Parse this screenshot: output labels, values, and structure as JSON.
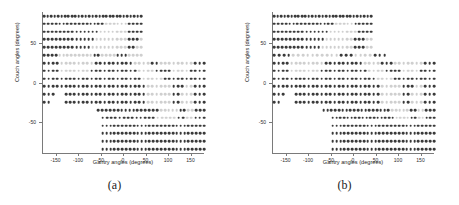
{
  "figure": {
    "panels": [
      {
        "id": "panel-a",
        "label": "(a)",
        "xlabel": "Gantry angles (degrees)",
        "ylabel": "Couch angles (degrees)"
      },
      {
        "id": "panel-b",
        "label": "(b)",
        "xlabel": "Gantry angles (degrees)",
        "ylabel": "Couch angles (degrees)"
      }
    ]
  },
  "colors": {
    "dot_dark": "#3a3a3a",
    "dot_mid": "#8d8d8d",
    "dot_light": "#cfcfcf",
    "axis": "#7a7a7a",
    "text": "#1d1d1d",
    "background": "#ffffff"
  },
  "chart_data": [
    {
      "type": "scatter",
      "panel": "(a)",
      "title": "",
      "xlabel": "Gantry angles (degrees)",
      "ylabel": "Couch angles (degrees)",
      "xlim": [
        -180,
        180
      ],
      "ylim": [
        -90,
        90
      ],
      "xticks": [
        -150,
        -100,
        -50,
        0,
        50,
        100,
        150
      ],
      "xticklabels": [
        "-150",
        "-100",
        "-50",
        "0",
        "50",
        "100",
        "150"
      ],
      "yticks": [
        50,
        0,
        -50
      ],
      "yticklabels": [
        "50",
        "0",
        "-50"
      ],
      "grid": false,
      "legend": "none",
      "marker": "filled-circle",
      "value_encoding": "greyscale: dark = high value, light grey = low value",
      "x_step": 7.5,
      "y_step": 10,
      "rows": [
        {
          "couch": 85,
          "x_from": -175,
          "x_to": 40,
          "pattern": "DDDDDDDDDDDDDDDDDDDDDDDDDDDDD"
        },
        {
          "couch": 75,
          "x_from": -175,
          "x_to": 40,
          "pattern": "DDDDDDDDDDDDDDDDLLLLLLDDDD"
        },
        {
          "couch": 65,
          "x_from": -175,
          "x_to": 40,
          "pattern": "DDDDDDDDDDDDDDLLLLLLLDDDD"
        },
        {
          "couch": 55,
          "x_from": -175,
          "x_to": 40,
          "pattern": "DDDDDDDDDDDDDLLLLLLLLDDDL"
        },
        {
          "couch": 45,
          "x_from": -175,
          "x_to": 40,
          "pattern": "DDDDDDDDDDDDLLLLLLLLLDDLL"
        },
        {
          "couch": 35,
          "x_from": -175,
          "x_to": 40,
          "pattern": "DDDDLLLLLLLLLDDLLLLDDDLLLL"
        },
        {
          "couch": 25,
          "x_from": -175,
          "x_to": 180,
          "pattern": "DDDDLLLLLLLLDDDDDDDDDLLLLDDLLLLLLLLDDD"
        },
        {
          "couch": 15,
          "x_from": -175,
          "x_to": 180,
          "pattern": "DDDDLLLLLLLDDDDDDDDDDDLLLLDDDDLLLLDDDD"
        },
        {
          "couch": 5,
          "x_from": -175,
          "x_to": 180,
          "pattern": "DDDDDDDDDDDDDDDDDDDDDDDLLLLLDDDDDDDDDD"
        },
        {
          "couch": -5,
          "x_from": -175,
          "x_to": 180,
          "pattern": "DDDDDDDDDDDDDDDDDDDDDDDDLLLLLLDDDLLDDD"
        },
        {
          "couch": -15,
          "x_from": -175,
          "x_to": 180,
          "pattern": "DDD__DDDDDDDDDDDDDDDDDDDLLLLLLDDLLLDDD"
        },
        {
          "couch": -25,
          "x_from": -175,
          "x_to": 180,
          "pattern": "DD___DDDDDDDDDDDDDDDDDDDLLLLLLDDLLLDDD"
        },
        {
          "couch": -35,
          "x_from": -55,
          "x_to": 180,
          "pattern": "DDDDDDDDDDDDDDDDLLLLLDDLLDDD"
        },
        {
          "couch": -45,
          "x_from": -45,
          "x_to": 180,
          "pattern": "DDDDDDDDDDDDDLLLLLDDLLDDD"
        },
        {
          "couch": -55,
          "x_from": -45,
          "x_to": 180,
          "pattern": "DDDDDDDDDDDDDDDDDDDDDDDDDDD"
        },
        {
          "couch": -65,
          "x_from": -45,
          "x_to": 180,
          "pattern": "DDDDDDDDDDDDDDDDDDDDDDDDDDD"
        },
        {
          "couch": -75,
          "x_from": -45,
          "x_to": 180,
          "pattern": "DDDDDDDDDDDDDDDDDDDDDDDDDDD"
        },
        {
          "couch": -85,
          "x_from": -45,
          "x_to": 180,
          "pattern": "DDDDDDDDDDDDDDDDDDDDDDDDDDD"
        }
      ]
    },
    {
      "type": "scatter",
      "panel": "(b)",
      "title": "",
      "xlabel": "Gantry angles (degrees)",
      "ylabel": "Couch angles (degrees)",
      "xlim": [
        -180,
        180
      ],
      "ylim": [
        -90,
        90
      ],
      "xticks": [
        -150,
        -100,
        -50,
        0,
        50,
        100,
        150
      ],
      "xticklabels": [
        "-150",
        "-100",
        "-50",
        "0",
        "50",
        "100",
        "150"
      ],
      "yticks": [
        50,
        0,
        -50
      ],
      "yticklabels": [
        "50",
        "0",
        "-50"
      ],
      "grid": false,
      "legend": "none",
      "marker": "filled-circle",
      "value_encoding": "greyscale: dark = high value, light grey = low value",
      "x_step": 7.5,
      "y_step": 10,
      "rows": [
        {
          "couch": 85,
          "x_from": -175,
          "x_to": 40,
          "pattern": "DDDDDDDDDDDDDDDDDDDDDDDDDDDDD"
        },
        {
          "couch": 75,
          "x_from": -175,
          "x_to": 40,
          "pattern": "DDDDDDDDDDDDDDDDLLLLLDDDDD"
        },
        {
          "couch": 65,
          "x_from": -175,
          "x_to": 40,
          "pattern": "DDDDDDDDDDDDDDLLLLLLLDDDD"
        },
        {
          "couch": 55,
          "x_from": -175,
          "x_to": 40,
          "pattern": "DDDDDDDDDDDDDLLLLLLLDDDLL"
        },
        {
          "couch": 45,
          "x_from": -175,
          "x_to": 40,
          "pattern": "DDDDDDDDDDDDLLLLLLLLDDDLL"
        },
        {
          "couch": 35,
          "x_from": -175,
          "x_to": 70,
          "pattern": "DDDDLLLLLLLLLLDDDLLLLDDD"
        },
        {
          "couch": 25,
          "x_from": -175,
          "x_to": 180,
          "pattern": "DDDDLLLLLLLLDDDDDDDDDLLLLDDDLLLLLLLDDD"
        },
        {
          "couch": 15,
          "x_from": -175,
          "x_to": 180,
          "pattern": "DDDDLLLLLLLDDDDDDDDDDDLLLLDDDDLLLLDDDD"
        },
        {
          "couch": 5,
          "x_from": -175,
          "x_to": 180,
          "pattern": "DDDDDDDDDDDDDDDDDDDDDDDDLLLLDDDDDDDDDD"
        },
        {
          "couch": -5,
          "x_from": -175,
          "x_to": 180,
          "pattern": "DDDDDDDDDDDDDDDDDDDDDDDDDLLLLLDDDLLDDD"
        },
        {
          "couch": -15,
          "x_from": -175,
          "x_to": 180,
          "pattern": "DDD__DDDDDDDDDDDDDDDDDDDDLLLLLDDLLLDDD"
        },
        {
          "couch": -25,
          "x_from": -175,
          "x_to": 180,
          "pattern": "DD___DDDDDDDDDDDDDDDDDDDDLLLLLDDLLLDDD"
        },
        {
          "couch": -35,
          "x_from": -65,
          "x_to": 180,
          "pattern": "DDDDDDDDDDDDDDDDDDLLLLLDDLLDDD"
        },
        {
          "couch": -45,
          "x_from": -45,
          "x_to": 180,
          "pattern": "DDDDDDDDDDDDDDDDDLLLLDDLLDDD"
        },
        {
          "couch": -55,
          "x_from": -45,
          "x_to": 180,
          "pattern": "DDDDDDDDDDDDDDDDDDDDDDDDDDD"
        },
        {
          "couch": -65,
          "x_from": -45,
          "x_to": 180,
          "pattern": "DDDDDDDDDDDDDDDDDDDDDDDDDDD"
        },
        {
          "couch": -75,
          "x_from": -45,
          "x_to": 180,
          "pattern": "DDDDDDDDDDDDDDDDDDDDDDDDDDD"
        },
        {
          "couch": -85,
          "x_from": -45,
          "x_to": 180,
          "pattern": "DDDDDDDDDDDDDDDDDDDDDDDDDDD"
        }
      ]
    }
  ]
}
